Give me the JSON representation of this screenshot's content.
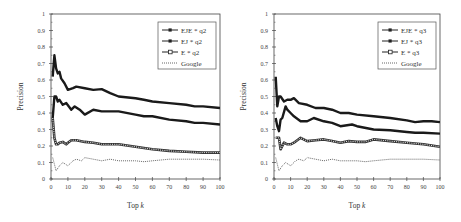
{
  "chart_data": [
    {
      "type": "line",
      "title": "",
      "xlabel": "Top k",
      "ylabel": "Precision",
      "xlim": [
        0,
        100
      ],
      "ylim": [
        0,
        1
      ],
      "xticks": [
        0,
        10,
        20,
        30,
        40,
        50,
        60,
        70,
        80,
        90,
        100
      ],
      "yticks": [
        0,
        0.1,
        0.2,
        0.3,
        0.4,
        0.5,
        0.6,
        0.7,
        0.8,
        0.9,
        1
      ],
      "grid": false,
      "legend_position": "upper right",
      "series": [
        {
          "name": "EJE * q2",
          "style": "solid-thick-markers",
          "x": [
            1,
            2,
            3,
            4,
            5,
            6,
            8,
            10,
            13,
            15,
            20,
            25,
            30,
            35,
            40,
            50,
            55,
            60,
            70,
            80,
            85,
            90,
            100
          ],
          "values": [
            0.62,
            0.75,
            0.67,
            0.64,
            0.65,
            0.61,
            0.58,
            0.54,
            0.55,
            0.56,
            0.55,
            0.54,
            0.545,
            0.52,
            0.5,
            0.49,
            0.48,
            0.47,
            0.46,
            0.45,
            0.44,
            0.44,
            0.43
          ]
        },
        {
          "name": "EJ * q2",
          "style": "solid-thick-markers",
          "x": [
            1,
            2,
            3,
            4,
            5,
            7,
            9,
            12,
            14,
            17,
            20,
            25,
            30,
            35,
            40,
            50,
            55,
            60,
            70,
            80,
            85,
            90,
            100
          ],
          "values": [
            0.37,
            0.5,
            0.5,
            0.47,
            0.48,
            0.45,
            0.46,
            0.42,
            0.44,
            0.42,
            0.39,
            0.42,
            0.41,
            0.41,
            0.41,
            0.39,
            0.38,
            0.38,
            0.36,
            0.35,
            0.34,
            0.34,
            0.33
          ]
        },
        {
          "name": "E * q2",
          "style": "solid-square-markers",
          "x": [
            1,
            2,
            3,
            4,
            5,
            7,
            9,
            10,
            12,
            15,
            20,
            25,
            30,
            35,
            40,
            50,
            60,
            70,
            80,
            90,
            100
          ],
          "values": [
            0.37,
            0.25,
            0.21,
            0.21,
            0.22,
            0.225,
            0.21,
            0.22,
            0.235,
            0.235,
            0.225,
            0.22,
            0.21,
            0.21,
            0.21,
            0.195,
            0.18,
            0.17,
            0.165,
            0.16,
            0.16
          ]
        },
        {
          "name": "Google",
          "style": "dotted",
          "x": [
            1,
            2,
            3,
            5,
            7,
            10,
            13,
            15,
            18,
            20,
            25,
            30,
            35,
            40,
            50,
            55,
            60,
            70,
            80,
            90,
            100
          ],
          "values": [
            0.13,
            0.09,
            0.05,
            0.08,
            0.1,
            0.08,
            0.11,
            0.12,
            0.11,
            0.13,
            0.12,
            0.11,
            0.12,
            0.11,
            0.11,
            0.105,
            0.11,
            0.12,
            0.12,
            0.12,
            0.115
          ]
        }
      ]
    },
    {
      "type": "line",
      "title": "",
      "xlabel": "Top k",
      "ylabel": "Precision",
      "xlim": [
        0,
        100
      ],
      "ylim": [
        0,
        1
      ],
      "xticks": [
        0,
        10,
        20,
        30,
        40,
        50,
        60,
        70,
        80,
        90,
        100
      ],
      "yticks": [
        0,
        0.1,
        0.2,
        0.3,
        0.4,
        0.5,
        0.6,
        0.7,
        0.8,
        0.9,
        1
      ],
      "grid": false,
      "legend_position": "upper right",
      "series": [
        {
          "name": "EJE * q3",
          "style": "solid-thick-markers",
          "x": [
            1,
            2,
            3,
            4,
            6,
            8,
            10,
            12,
            15,
            20,
            25,
            30,
            35,
            40,
            45,
            50,
            60,
            70,
            80,
            85,
            90,
            95,
            100
          ],
          "values": [
            0.62,
            0.44,
            0.5,
            0.5,
            0.47,
            0.48,
            0.48,
            0.49,
            0.46,
            0.45,
            0.43,
            0.43,
            0.42,
            0.4,
            0.4,
            0.39,
            0.38,
            0.37,
            0.355,
            0.345,
            0.35,
            0.35,
            0.345
          ]
        },
        {
          "name": "EJ * q3",
          "style": "solid-thick-markers",
          "x": [
            1,
            2,
            3,
            4,
            5,
            7,
            8,
            10,
            12,
            16,
            20,
            24,
            30,
            35,
            40,
            47,
            50,
            60,
            70,
            80,
            85,
            90,
            100
          ],
          "values": [
            0.37,
            0.32,
            0.29,
            0.36,
            0.37,
            0.44,
            0.42,
            0.4,
            0.38,
            0.35,
            0.35,
            0.37,
            0.35,
            0.34,
            0.32,
            0.33,
            0.32,
            0.3,
            0.295,
            0.285,
            0.28,
            0.28,
            0.275
          ]
        },
        {
          "name": "E * q3",
          "style": "solid-square-markers",
          "x": [
            1,
            2,
            3,
            4,
            5,
            6,
            8,
            10,
            12,
            16,
            20,
            25,
            30,
            35,
            40,
            45,
            50,
            55,
            60,
            70,
            80,
            90,
            100
          ],
          "values": [
            0.25,
            0.25,
            0.25,
            0.18,
            0.2,
            0.22,
            0.21,
            0.21,
            0.22,
            0.25,
            0.23,
            0.235,
            0.24,
            0.23,
            0.22,
            0.23,
            0.225,
            0.225,
            0.24,
            0.23,
            0.22,
            0.21,
            0.195
          ]
        },
        {
          "name": "Google",
          "style": "dotted",
          "x": [
            1,
            2,
            3,
            5,
            7,
            10,
            13,
            15,
            18,
            20,
            25,
            30,
            35,
            40,
            50,
            55,
            60,
            70,
            80,
            90,
            100
          ],
          "values": [
            0.13,
            0.09,
            0.05,
            0.08,
            0.1,
            0.08,
            0.11,
            0.12,
            0.11,
            0.13,
            0.12,
            0.11,
            0.12,
            0.11,
            0.11,
            0.105,
            0.11,
            0.12,
            0.12,
            0.12,
            0.115
          ]
        }
      ]
    }
  ],
  "charts": [
    {
      "ylabel": "Precision",
      "xlabel_main": "Top ",
      "xlabel_var": "k",
      "legend": [
        "EJE * q2",
        "EJ * q2",
        "E * q2",
        "Google"
      ]
    },
    {
      "ylabel": "Precision",
      "xlabel_main": "Top ",
      "xlabel_var": "k",
      "legend": [
        "EJE * q3",
        "EJ * q3",
        "E * q3",
        "Google"
      ]
    }
  ],
  "colors": {
    "line": "#1a1a1a",
    "axis": "#444444",
    "google": "#555555"
  }
}
